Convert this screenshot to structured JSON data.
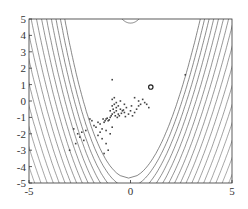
{
  "chart_data": {
    "type": "contour",
    "title": "",
    "xlabel": "",
    "ylabel": "",
    "xlim": [
      -5,
      5
    ],
    "ylim": [
      -5,
      5
    ],
    "xticks": [
      -5,
      0,
      5
    ],
    "yticks": [
      -5,
      -4,
      -3,
      -2,
      -1,
      0,
      1,
      2,
      3,
      4,
      5
    ],
    "grid": false,
    "legend": null,
    "function_shape": "Rosenbrock-like banana valley, contours open upward (y ≈ x²)",
    "contour_levels_innermost_vertex_y": -4.7,
    "extra_contour_top": {
      "center_x": 0,
      "vertex_y": 4.75,
      "half_width": 0.5
    },
    "minimum_marker": {
      "x": 1.0,
      "y": 0.85,
      "style": "open circle"
    },
    "scatter_points": [
      [
        -1.2,
        -1.1
      ],
      [
        -1.1,
        -1.2
      ],
      [
        -1.0,
        -1.0
      ],
      [
        -1.3,
        -1.3
      ],
      [
        -1.15,
        -1.05
      ],
      [
        -1.25,
        -1.2
      ],
      [
        -1.05,
        -1.15
      ],
      [
        -1.35,
        -1.1
      ],
      [
        -0.9,
        -0.8
      ],
      [
        -0.8,
        -0.7
      ],
      [
        -0.7,
        -0.6
      ],
      [
        -0.85,
        -0.5
      ],
      [
        -0.75,
        -0.9
      ],
      [
        -0.6,
        -0.8
      ],
      [
        -0.9,
        -0.3
      ],
      [
        -0.8,
        -0.2
      ],
      [
        -0.7,
        -0.4
      ],
      [
        -0.6,
        -0.3
      ],
      [
        -0.5,
        -0.5
      ],
      [
        -0.4,
        -0.6
      ],
      [
        -0.3,
        -0.7
      ],
      [
        -0.2,
        -0.4
      ],
      [
        -0.1,
        -0.8
      ],
      [
        0.0,
        -0.6
      ],
      [
        0.1,
        -0.9
      ],
      [
        0.2,
        -0.7
      ],
      [
        0.3,
        -0.5
      ],
      [
        0.4,
        -0.3
      ],
      [
        0.5,
        -0.2
      ],
      [
        0.6,
        0.1
      ],
      [
        0.8,
        -0.2
      ],
      [
        0.9,
        -0.4
      ],
      [
        -0.9,
        0.1
      ],
      [
        -0.8,
        0.2
      ],
      [
        -0.7,
        -0.1
      ],
      [
        -0.5,
        0.0
      ],
      [
        -0.3,
        -0.2
      ],
      [
        0.2,
        0.2
      ],
      [
        0.4,
        0.0
      ],
      [
        0.7,
        -0.1
      ],
      [
        -1.5,
        -1.4
      ],
      [
        -1.6,
        -1.3
      ],
      [
        -1.7,
        -1.6
      ],
      [
        -1.8,
        -1.5
      ],
      [
        -1.4,
        -1.7
      ],
      [
        -1.5,
        -1.9
      ],
      [
        -1.9,
        -1.2
      ],
      [
        -2.0,
        -1.1
      ],
      [
        -1.6,
        -2.1
      ],
      [
        -1.4,
        -2.3
      ],
      [
        -1.2,
        -2.6
      ],
      [
        -1.1,
        -3.0
      ],
      [
        -1.3,
        -3.2
      ],
      [
        -1.0,
        -2.0
      ],
      [
        -1.2,
        -1.8
      ],
      [
        -0.9,
        -1.6
      ],
      [
        -2.2,
        -1.8
      ],
      [
        -2.4,
        -1.9
      ],
      [
        -2.6,
        -2.0
      ],
      [
        -2.3,
        -2.4
      ],
      [
        -2.8,
        -1.7
      ],
      [
        -2.5,
        -2.2
      ],
      [
        -3.0,
        -3.0
      ],
      [
        -2.7,
        -2.6
      ],
      [
        -1.0,
        -0.6
      ],
      [
        -0.95,
        -0.9
      ],
      [
        -0.65,
        -1.0
      ],
      [
        -0.55,
        -0.9
      ],
      [
        -0.45,
        -0.75
      ],
      [
        -0.35,
        -0.55
      ],
      [
        -0.25,
        -0.95
      ],
      [
        0.05,
        -0.3
      ],
      [
        -0.9,
        1.3
      ],
      [
        2.7,
        1.6
      ]
    ]
  },
  "axes": {
    "x_tick_labels": [
      "-5",
      "0",
      "5"
    ],
    "y_tick_labels": [
      "5",
      "4",
      "3",
      "2",
      "1",
      "0",
      "-1",
      "-2",
      "-3",
      "-4",
      "-5"
    ]
  },
  "colors": {
    "contour": "#555555",
    "points": "#444444",
    "frame": "#333333",
    "dense_region": "#d6d6d6"
  }
}
